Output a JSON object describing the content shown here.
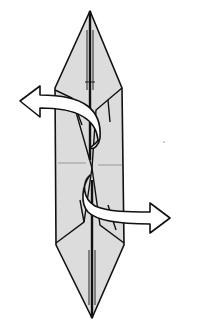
{
  "diagram": {
    "type": "origami-fold-step",
    "colors": {
      "paper": "#dcdcdc",
      "line": "#111111",
      "background": "#ffffff",
      "arrow_fill": "#ffffff"
    },
    "arrows": [
      {
        "id": "upper-arrow",
        "direction": "left"
      },
      {
        "id": "lower-arrow",
        "direction": "right"
      }
    ]
  }
}
